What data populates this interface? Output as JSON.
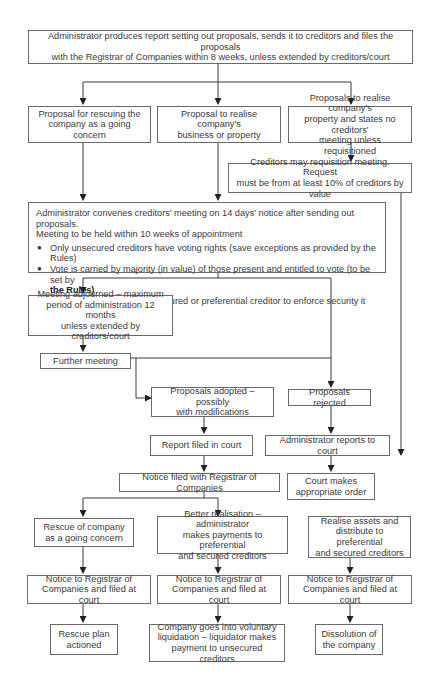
{
  "diagram": {
    "type": "flowchart",
    "line_color": "#3a3a3a",
    "box_border_color": "#6a6a6a",
    "nodes": {
      "report": {
        "text": "Administrator produces report setting out proposals, sends it to creditors and files the proposals\nwith the Registrar of Companies within 8 weeks, unless extended by creditors/court"
      },
      "proposal_rescue": {
        "text": "Proposal for rescuing the\ncompany as a going concern"
      },
      "proposal_realise_business": {
        "text": "Proposal to realise company's\nbusiness or property"
      },
      "proposal_realise_no_meeting": {
        "text": "Proposals to realise company's\nproperty and states no creditors'\nmeeting unless requisitioned"
      },
      "requisition_meeting": {
        "text": "Creditors may requisition meeting. Request\nmust be from at least 10% of creditors by value"
      },
      "creditors_meeting": {
        "intro": "Administrator convenes creditors' meeting on 14 days' notice after sending out proposals.\nMeeting to be held within 10 weeks of appointment",
        "bullets": [
          {
            "text": "Only unsecured creditors have voting rights (save exceptions as provided by the Rules)"
          },
          {
            "text": "Vote is carried by majority (in value) of those present and entitled to vote (to be set by",
            "bold_tail": "the Rules)"
          },
          {
            "text": "If proposal affects right of secured or preferential creditor to enforce security it can only be\nadopted with their consent"
          }
        ],
        "bullet_glyph": "●"
      },
      "meeting_adjourned": {
        "text": "Meeting adjourned – maximum\nperiod of administration 12 months\nunless extended by creditors/court"
      },
      "further_meeting": {
        "text": "Further meeting"
      },
      "proposals_adopted": {
        "text": "Proposals adopted – possibly\nwith modifications"
      },
      "proposals_rejected": {
        "text": "Proposals rejected"
      },
      "report_filed": {
        "text": "Report filed in court"
      },
      "admin_reports_court": {
        "text": "Administrator reports to court"
      },
      "notice_filed_registrar": {
        "text": "Notice filed with Registrar of Companies"
      },
      "court_order": {
        "text": "Court makes\nappropriate order"
      },
      "rescue_going_concern": {
        "text": "Rescue of company\nas a going concern"
      },
      "better_realisation": {
        "text": "Better realisation – administrator\nmakes payments to preferential\nand secured creditors"
      },
      "realise_assets": {
        "text": "Realise assets and\ndistribute to preferential\nand secured creditors"
      },
      "notice_left": {
        "text": "Notice to Registrar of\nCompanies and filed at court"
      },
      "notice_mid": {
        "text": "Notice to Registrar of\nCompanies and filed at court"
      },
      "notice_right": {
        "text": "Notice to Registrar of\nCompanies and filed at court"
      },
      "rescue_plan": {
        "text": "Rescue plan\nactioned"
      },
      "voluntary_liquidation": {
        "text": "Company goes into voluntary\nliquidation – liquidator makes\npayment to unsecured creditors"
      },
      "dissolution": {
        "text": "Dissolution of\nthe company"
      }
    }
  }
}
